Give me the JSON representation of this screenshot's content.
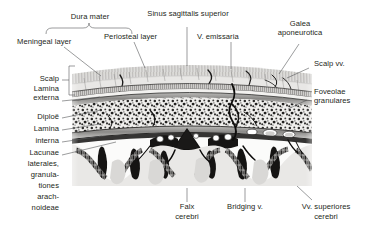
{
  "figure": {
    "type": "anatomical-illustration",
    "style": "grayscale histological line drawing",
    "background_color": "#ffffff",
    "ink_color": "#231f20",
    "leader_color": "#58595b"
  },
  "labels": {
    "dura_mater": "Dura mater",
    "sinus_sagittalis_superior": "Sinus sagittalis superior",
    "galea_aponeurotica_line1": "Galea",
    "galea_aponeurotica_line2": "aponeurotica",
    "meningeal_layer": "Meningeal layer",
    "periosteal_layer": "Periosteal layer",
    "v_emissaria": "V. emissaria",
    "scalp_vv": "Scalp vv.",
    "scalp": "Scalp",
    "lamina_externa_line1": "Lamina",
    "lamina_externa_line2": "externa",
    "diploe": "Diploë",
    "lamina_interna_line1": "Lamina",
    "lamina_interna_line2": "interna",
    "lacunae_line1": "Lacunae",
    "lacunae_line2": "laterales,",
    "lacunae_line3": "granula-",
    "lacunae_line4": "tiones",
    "lacunae_line5": "arach-",
    "lacunae_line6": "noideae",
    "foveolae_line1": "Foveolae",
    "foveolae_line2": "granulares",
    "falx_line1": "Falx",
    "falx_line2": "cerebri",
    "bridging_v": "Bridging v.",
    "vv_superiores_line1": "Vv. superiores",
    "vv_superiores_line2": "cerebri"
  }
}
